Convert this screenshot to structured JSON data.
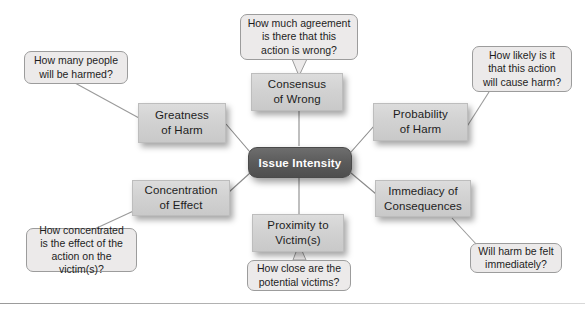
{
  "diagram": {
    "center": {
      "label": "Issue Intensity"
    },
    "nodes": [
      {
        "id": "greatness-of-harm",
        "label": "Greatness\nof Harm"
      },
      {
        "id": "consensus-of-wrong",
        "label": "Consensus\nof Wrong"
      },
      {
        "id": "probability-of-harm",
        "label": "Probability\nof Harm"
      },
      {
        "id": "immediacy-of-consequences",
        "label": "Immediacy of\nConsequences"
      },
      {
        "id": "proximity-to-victims",
        "label": "Proximity to\nVictim(s)"
      },
      {
        "id": "concentration-of-effect",
        "label": "Concentration\nof Effect"
      }
    ],
    "callouts": [
      {
        "id": "greatness-of-harm-question",
        "text": "How many people\nwill be harmed?"
      },
      {
        "id": "consensus-of-wrong-question",
        "text": "How much agreement\nis there that this\naction is wrong?"
      },
      {
        "id": "probability-of-harm-question",
        "text": "How likely is it\nthat this action\nwill cause harm?"
      },
      {
        "id": "immediacy-of-consequences-question",
        "text": "Will harm be felt\nimmediately?"
      },
      {
        "id": "proximity-to-victims-question",
        "text": "How close are the\npotential victims?"
      },
      {
        "id": "concentration-of-effect-question",
        "text": "How concentrated\nis the effect of the\naction on the victim(s)?"
      }
    ],
    "colors": {
      "center_fill": "#5b5b5b",
      "center_text": "#ffffff",
      "node_fill": "#d2d2d2",
      "node_text": "#1d1d1d",
      "callout_fill": "#eceaea",
      "callout_border": "#9c9c9c",
      "connector": "#8a8a8a",
      "background": "#ffffff"
    }
  }
}
